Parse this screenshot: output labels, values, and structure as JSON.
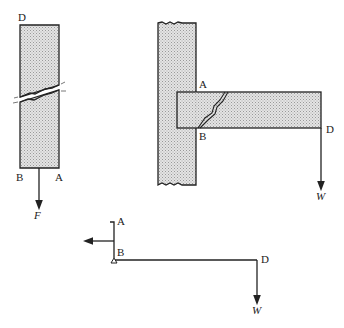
{
  "figure": {
    "left_bar": {
      "labels": {
        "top": "D",
        "bottom_left": "B",
        "bottom_right": "A",
        "force": "F"
      }
    },
    "t_joint": {
      "labels": {
        "upper": "A",
        "lower": "B",
        "tip": "D",
        "force": "W"
      }
    },
    "free_body": {
      "labels": {
        "top": "A",
        "pivot": "B",
        "tip": "D",
        "force": "W"
      }
    },
    "colors": {
      "stroke": "#222222",
      "fill": "#d6d6d6"
    }
  }
}
